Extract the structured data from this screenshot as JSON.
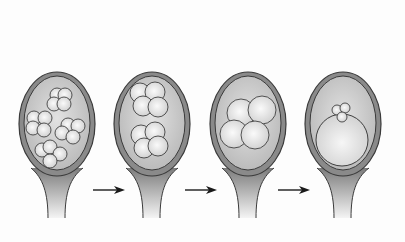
{
  "diagram": {
    "title": "",
    "background": "#fdfdfd",
    "colors": {
      "wall_fill": "#8a8a8a",
      "wall_stroke": "#3a3a3a",
      "inner_fill": "#c8c8c8",
      "cell_fill_light": "#f6f6f6",
      "cell_fill_dark": "#d2d2d2",
      "cell_stroke": "#2e2e2e",
      "arrow": "#1a1a1a"
    },
    "ovules": [
      {
        "id": "stage-1",
        "cx": 57,
        "cells": [
          [
            57,
            95,
            7
          ],
          [
            65,
            95,
            7
          ],
          [
            54,
            104,
            7
          ],
          [
            64,
            104,
            7
          ],
          [
            34,
            118,
            7
          ],
          [
            45,
            118,
            7
          ],
          [
            33,
            128,
            7
          ],
          [
            44,
            130,
            7
          ],
          [
            68,
            125,
            7
          ],
          [
            78,
            126,
            7
          ],
          [
            62,
            133,
            7
          ],
          [
            73,
            137,
            7
          ],
          [
            42,
            150,
            7
          ],
          [
            50,
            147,
            7
          ],
          [
            60,
            154,
            7
          ],
          [
            50,
            161,
            7
          ]
        ]
      },
      {
        "id": "stage-2",
        "cx": 152,
        "cells": [
          [
            140,
            93,
            10
          ],
          [
            155,
            92,
            10
          ],
          [
            143,
            106,
            10
          ],
          [
            158,
            107,
            10
          ],
          [
            141,
            135,
            10
          ],
          [
            155,
            132,
            10
          ],
          [
            144,
            148,
            10
          ],
          [
            158,
            146,
            10
          ]
        ]
      },
      {
        "id": "stage-3",
        "cx": 248,
        "cells": [
          [
            241,
            113,
            14
          ],
          [
            262,
            110,
            14
          ],
          [
            234,
            134,
            14
          ],
          [
            255,
            135,
            14
          ]
        ]
      },
      {
        "id": "stage-4",
        "cx": 343,
        "large_cell": [
          342,
          140,
          26
        ],
        "cells": [
          [
            337,
            110,
            5
          ],
          [
            345,
            108,
            5
          ],
          [
            342,
            117,
            5
          ]
        ]
      }
    ],
    "arrows": [
      {
        "x1": 93,
        "x2": 125,
        "y": 190
      },
      {
        "x1": 185,
        "x2": 217,
        "y": 190
      },
      {
        "x1": 278,
        "x2": 310,
        "y": 190
      }
    ]
  }
}
